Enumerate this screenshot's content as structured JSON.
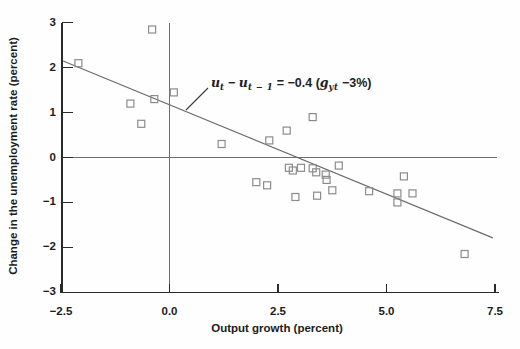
{
  "chart_data": {
    "type": "scatter",
    "title": "",
    "xlabel": "Output growth (percent)",
    "ylabel": "Change in the unemployment rate (percent)",
    "xlim": [
      -2.5,
      7.5
    ],
    "ylim": [
      -3,
      3
    ],
    "x_ticks": [
      -2.5,
      0.0,
      2.5,
      5.0,
      7.5
    ],
    "x_tick_labels": [
      "−2.5",
      "0.0",
      "2.5",
      "5.0",
      "7.5"
    ],
    "y_ticks": [
      3,
      2,
      1,
      0,
      -1,
      -2,
      -3
    ],
    "y_tick_labels": [
      "3",
      "2",
      "1",
      "0",
      "−1",
      "−2",
      "−3"
    ],
    "zero_line_x": 0,
    "zero_line_y": 0,
    "grid": "off",
    "legend": "none",
    "marker": "open-square",
    "marker_color": "#8c8c8c",
    "line_color": "#6b6b6b",
    "axis_color": "#2a2a2a",
    "points": [
      [
        -2.1,
        2.1
      ],
      [
        -0.4,
        2.85
      ],
      [
        -0.9,
        1.2
      ],
      [
        -0.35,
        1.3
      ],
      [
        0.1,
        1.45
      ],
      [
        -0.65,
        0.75
      ],
      [
        1.2,
        0.3
      ],
      [
        2.3,
        0.38
      ],
      [
        2.7,
        0.6
      ],
      [
        3.3,
        0.9
      ],
      [
        2.0,
        -0.55
      ],
      [
        2.25,
        -0.62
      ],
      [
        2.75,
        -0.23
      ],
      [
        2.84,
        -0.29
      ],
      [
        3.03,
        -0.23
      ],
      [
        3.3,
        -0.24
      ],
      [
        3.38,
        -0.33
      ],
      [
        3.6,
        -0.38
      ],
      [
        3.62,
        -0.5
      ],
      [
        3.9,
        -0.18
      ],
      [
        2.9,
        -0.88
      ],
      [
        3.4,
        -0.85
      ],
      [
        3.75,
        -0.73
      ],
      [
        4.6,
        -0.75
      ],
      [
        5.4,
        -0.42
      ],
      [
        5.25,
        -0.8
      ],
      [
        5.6,
        -0.8
      ],
      [
        5.25,
        -1.0
      ],
      [
        6.8,
        -2.15
      ]
    ],
    "regression_line": {
      "x1": -2.45,
      "y1": 2.15,
      "x2": 7.45,
      "y2": -1.79,
      "slope": -0.4,
      "equation": "u_t - u_{t-1} = -0.4 (g_yt - 3%)"
    },
    "annotation": {
      "segments": [
        {
          "text": "u",
          "style": "var"
        },
        {
          "text": "t",
          "style": "sub"
        },
        {
          "text": " − ",
          "style": "plain"
        },
        {
          "text": "u",
          "style": "var"
        },
        {
          "text": "t − 1",
          "style": "sub"
        },
        {
          "text": " = −0.4 (",
          "style": "plain"
        },
        {
          "text": "g",
          "style": "var"
        },
        {
          "text": "yt",
          "style": "sub"
        },
        {
          "text": " −3%)",
          "style": "plain"
        }
      ]
    }
  }
}
